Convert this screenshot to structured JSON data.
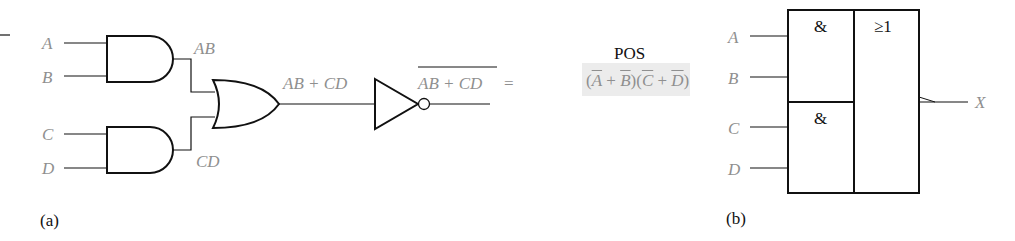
{
  "figure_a": {
    "caption": "(a)",
    "inputs": [
      "A",
      "B",
      "C",
      "D"
    ],
    "and_outputs": [
      "AB",
      "CD"
    ],
    "or_output": "AB + CD",
    "inverter_output": "AB + CD",
    "equals": "=",
    "pos_title": "POS",
    "pos_expression": {
      "open1": "(",
      "t1": "A",
      "plus1": " + ",
      "t2": "B",
      "mid": ")(",
      "t3": "C",
      "plus2": " + ",
      "t4": "D",
      "close": ")"
    }
  },
  "figure_b": {
    "caption": "(b)",
    "inputs": [
      "A",
      "B",
      "C",
      "D"
    ],
    "and_symbol": "&",
    "or_symbol": "≥1",
    "output": "X"
  },
  "colors": {
    "line": "#111111",
    "label": "#8f8f8f",
    "highlight": "#ececec"
  }
}
